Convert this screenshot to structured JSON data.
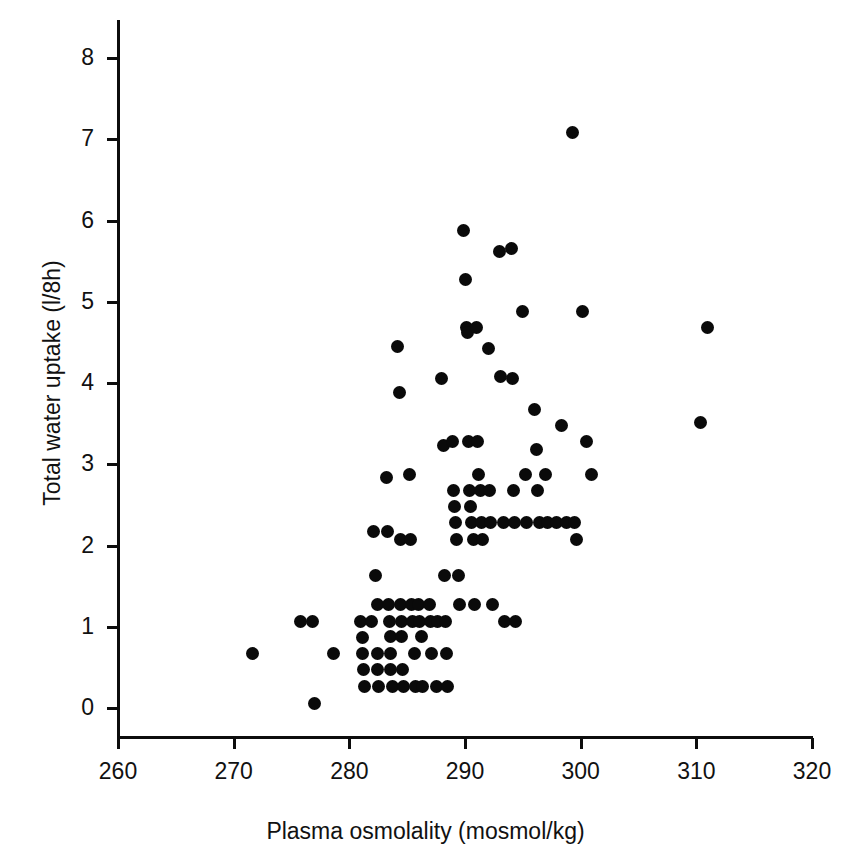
{
  "chart_data": {
    "type": "scatter",
    "title": "",
    "xlabel": "Plasma osmolality (mosmol/kg)",
    "ylabel": "Total water uptake (l/8h)",
    "xlim": [
      260,
      320
    ],
    "ylim": [
      0,
      8
    ],
    "xticks": [
      260,
      270,
      280,
      290,
      300,
      310,
      320
    ],
    "yticks": [
      0,
      1,
      2,
      3,
      4,
      5,
      6,
      7,
      8
    ],
    "grid": false,
    "legend": null,
    "marker": {
      "shape": "circle",
      "color": "#0a0a0a",
      "size_px": 13
    },
    "n_points": 134,
    "points": [
      [
        271.6,
        0.67
      ],
      [
        275.8,
        1.07
      ],
      [
        276.8,
        1.07
      ],
      [
        277.0,
        0.05
      ],
      [
        278.6,
        0.67
      ],
      [
        281.0,
        1.07
      ],
      [
        281.9,
        1.07
      ],
      [
        281.1,
        0.87
      ],
      [
        281.1,
        0.67
      ],
      [
        281.2,
        0.48
      ],
      [
        281.3,
        0.27
      ],
      [
        282.1,
        2.17
      ],
      [
        282.3,
        1.63
      ],
      [
        282.4,
        1.28
      ],
      [
        282.4,
        0.67
      ],
      [
        282.4,
        0.48
      ],
      [
        282.5,
        0.27
      ],
      [
        283.2,
        2.84
      ],
      [
        283.3,
        2.17
      ],
      [
        283.4,
        1.28
      ],
      [
        283.5,
        1.07
      ],
      [
        283.6,
        0.88
      ],
      [
        283.6,
        0.67
      ],
      [
        283.6,
        0.48
      ],
      [
        283.7,
        0.27
      ],
      [
        284.2,
        4.45
      ],
      [
        284.3,
        3.88
      ],
      [
        284.4,
        2.07
      ],
      [
        284.4,
        1.28
      ],
      [
        284.5,
        1.07
      ],
      [
        284.5,
        0.88
      ],
      [
        284.6,
        0.48
      ],
      [
        284.7,
        0.27
      ],
      [
        285.2,
        2.88
      ],
      [
        285.3,
        2.07
      ],
      [
        285.4,
        1.28
      ],
      [
        285.5,
        1.07
      ],
      [
        285.6,
        0.67
      ],
      [
        285.7,
        0.27
      ],
      [
        286.0,
        1.28
      ],
      [
        286.1,
        1.07
      ],
      [
        286.2,
        0.88
      ],
      [
        286.3,
        0.27
      ],
      [
        286.9,
        1.28
      ],
      [
        287.0,
        1.07
      ],
      [
        287.1,
        0.67
      ],
      [
        287.5,
        0.27
      ],
      [
        287.6,
        1.07
      ],
      [
        288.0,
        4.05
      ],
      [
        288.1,
        3.23
      ],
      [
        288.2,
        1.63
      ],
      [
        288.3,
        1.07
      ],
      [
        288.4,
        0.67
      ],
      [
        288.5,
        0.27
      ],
      [
        288.9,
        3.28
      ],
      [
        289.0,
        2.68
      ],
      [
        289.1,
        2.48
      ],
      [
        289.2,
        2.28
      ],
      [
        289.3,
        2.07
      ],
      [
        289.4,
        1.63
      ],
      [
        289.5,
        1.28
      ],
      [
        289.9,
        5.88
      ],
      [
        290.0,
        5.28
      ],
      [
        290.1,
        4.68
      ],
      [
        290.2,
        4.62
      ],
      [
        290.3,
        3.28
      ],
      [
        290.4,
        2.68
      ],
      [
        290.5,
        2.48
      ],
      [
        290.6,
        2.28
      ],
      [
        290.7,
        2.07
      ],
      [
        290.8,
        1.28
      ],
      [
        291.0,
        4.68
      ],
      [
        291.1,
        3.28
      ],
      [
        291.2,
        2.88
      ],
      [
        291.3,
        2.68
      ],
      [
        291.4,
        2.28
      ],
      [
        291.5,
        2.07
      ],
      [
        292.0,
        4.42
      ],
      [
        292.1,
        2.68
      ],
      [
        292.2,
        2.28
      ],
      [
        292.4,
        1.28
      ],
      [
        293.0,
        5.62
      ],
      [
        293.1,
        4.08
      ],
      [
        293.3,
        2.28
      ],
      [
        293.4,
        1.07
      ],
      [
        294.0,
        5.65
      ],
      [
        294.1,
        4.05
      ],
      [
        294.2,
        2.68
      ],
      [
        294.3,
        2.28
      ],
      [
        294.4,
        1.07
      ],
      [
        295.0,
        4.88
      ],
      [
        295.2,
        2.88
      ],
      [
        295.3,
        2.28
      ],
      [
        296.0,
        3.68
      ],
      [
        296.2,
        3.18
      ],
      [
        296.3,
        2.68
      ],
      [
        296.4,
        2.28
      ],
      [
        297.0,
        2.88
      ],
      [
        297.1,
        2.28
      ],
      [
        297.9,
        2.28
      ],
      [
        298.3,
        3.48
      ],
      [
        298.8,
        2.28
      ],
      [
        299.3,
        7.08
      ],
      [
        299.5,
        2.28
      ],
      [
        299.6,
        2.08
      ],
      [
        300.2,
        4.88
      ],
      [
        300.5,
        3.28
      ],
      [
        300.9,
        2.88
      ],
      [
        310.4,
        3.51
      ],
      [
        311.0,
        4.68
      ]
    ]
  },
  "axes": {
    "x": {
      "label": "Plasma osmolality (mosmol/kg)",
      "ticks": [
        {
          "value": 260,
          "label": "260"
        },
        {
          "value": 270,
          "label": "270"
        },
        {
          "value": 280,
          "label": "280"
        },
        {
          "value": 290,
          "label": "290"
        },
        {
          "value": 300,
          "label": "300"
        },
        {
          "value": 310,
          "label": "310"
        },
        {
          "value": 320,
          "label": "320"
        }
      ]
    },
    "y": {
      "label": "Total water uptake (l/8h)",
      "ticks": [
        {
          "value": 0,
          "label": "0"
        },
        {
          "value": 1,
          "label": "1"
        },
        {
          "value": 2,
          "label": "2"
        },
        {
          "value": 3,
          "label": "3"
        },
        {
          "value": 4,
          "label": "4"
        },
        {
          "value": 5,
          "label": "5"
        },
        {
          "value": 6,
          "label": "6"
        },
        {
          "value": 7,
          "label": "7"
        },
        {
          "value": 8,
          "label": "8"
        }
      ]
    }
  }
}
